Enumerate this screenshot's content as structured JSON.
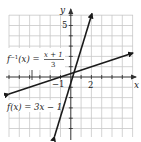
{
  "figure": {
    "type": "function-and-inverse-graph",
    "axes": {
      "x_label": "x",
      "y_label": "y",
      "x_range": [
        -6,
        6
      ],
      "y_range": [
        -6,
        6
      ],
      "tick_labels": {
        "x_two": "2",
        "y_five": "5",
        "neg_one": "−1"
      },
      "grid": true
    },
    "functions": [
      {
        "id": "f",
        "label": "f(x) = 3x − 1",
        "label_name": "f(x) = 3x − 1",
        "slope": 3,
        "intercept": -1
      },
      {
        "id": "f_inverse",
        "label_prefix": "f",
        "label_sup": "−1",
        "label_arg": "(x) =",
        "label_numerator": "x + 1",
        "label_denominator": "3",
        "slope": 0.3333,
        "intercept": 0.3333
      }
    ],
    "colors": {
      "grid": "#c8c8c8",
      "axis": "#333333",
      "line": "#1a1a1a",
      "text": "#222222"
    }
  }
}
